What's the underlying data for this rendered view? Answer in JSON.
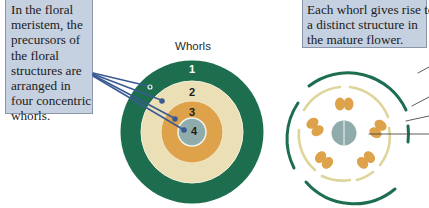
{
  "left_callout": {
    "lines": [
      "In the floral",
      "meristem, the",
      "precursors of",
      "the floral",
      "structures are",
      "arranged in",
      "four concentric",
      "whorls."
    ]
  },
  "right_callout": {
    "lines": [
      "Each whorl gives rise to",
      "a distinct structure in",
      "the mature flower."
    ]
  },
  "whorl_diagram": {
    "title": "Whorls",
    "rings": [
      {
        "label": "1",
        "color": "#1d6e4e"
      },
      {
        "label": "2",
        "color": "#ebdfb6"
      },
      {
        "label": "3",
        "color": "#dda24a"
      },
      {
        "label": "4",
        "color": "#90abab"
      }
    ],
    "pointer_color": "#3a5a92"
  },
  "flower_diagram": {
    "sepal_color": "#1d6e4e",
    "petal_color": "#ddd59a",
    "stamen_color": "#dda24a",
    "carpel_color": "#90abab"
  }
}
